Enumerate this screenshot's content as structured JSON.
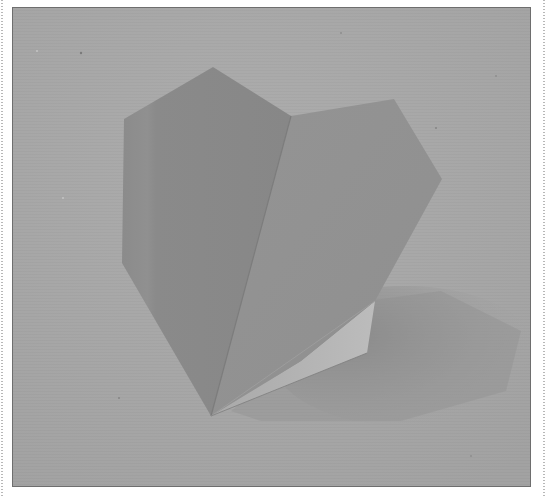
{
  "image": {
    "subject": "origami paper heart standing on a textured paper surface",
    "style": "grayscale photograph",
    "frame": {
      "border_color": "#6e6e6e",
      "page_background": "#ffffff"
    },
    "colors": {
      "background_surface": "#a7a7a7",
      "background_light": "#acacac",
      "shadow": "#8c8c8c",
      "heart_left_face": "#8a8a8a",
      "heart_right_face": "#929292",
      "heart_underside": "#b7b7b7",
      "fold_line": "#7c7c7c"
    }
  }
}
